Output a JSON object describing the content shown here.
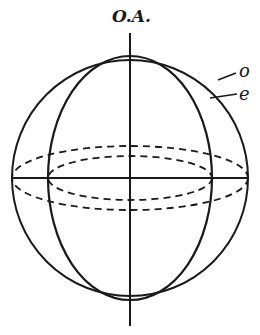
{
  "diagram": {
    "labels": {
      "optic_axis": "O.A.",
      "ordinary": "o",
      "extraordinary": "e"
    },
    "colors": {
      "line": "#1a1a1a",
      "background": "#ffffff"
    },
    "shapes": {
      "ordinary_surface": {
        "type": "circle",
        "cx": 130,
        "cy": 178,
        "r": 118
      },
      "extraordinary_surface": {
        "type": "ellipse",
        "cx": 130,
        "cy": 178,
        "rx": 82,
        "ry": 122
      },
      "optic_axis_line": {
        "x": 130,
        "y1": 33,
        "y2": 326
      },
      "equator_line": {
        "y": 178,
        "x1": 12,
        "x2": 248
      },
      "equator_outer_dashed": {
        "cx": 130,
        "cy": 178,
        "rx": 118,
        "ry": 32
      },
      "equator_inner_dashed": {
        "cx": 130,
        "cy": 178,
        "rx": 82,
        "ry": 22
      }
    }
  }
}
